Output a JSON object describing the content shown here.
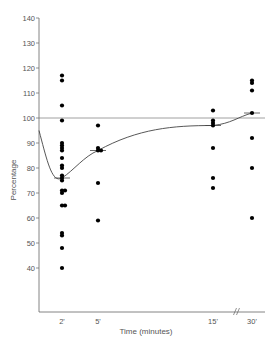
{
  "chart_data": {
    "type": "scatter",
    "title": "",
    "xlabel": "Time (minutes)",
    "ylabel": "Percentage",
    "ylim": [
      17.6,
      140
    ],
    "yticks": [
      40,
      50,
      60,
      70,
      80,
      90,
      100,
      110,
      120,
      130,
      140
    ],
    "xticks": [
      "2'",
      "5'",
      "15'",
      "30'"
    ],
    "axis_break_between": [
      "15'",
      "30'"
    ],
    "reference_line": 100,
    "grid": false,
    "legend": null,
    "series": [
      {
        "name": "individual values",
        "x": "2'",
        "values": [
          117,
          115,
          105,
          99,
          90,
          89,
          88,
          87,
          84,
          81,
          80,
          77,
          76,
          75,
          71,
          71,
          70,
          65,
          65,
          54,
          53,
          48,
          40
        ]
      },
      {
        "name": "individual values",
        "x": "5'",
        "values": [
          97,
          88,
          87,
          87,
          74,
          59
        ]
      },
      {
        "name": "individual values",
        "x": "15'",
        "values": [
          103,
          99,
          98,
          97,
          88,
          76,
          72
        ]
      },
      {
        "name": "individual values",
        "x": "30'",
        "values": [
          115,
          114,
          111,
          102,
          92,
          80,
          60
        ]
      }
    ],
    "mean_curve": [
      {
        "x": "0",
        "value": 95
      },
      {
        "x": "2'",
        "value": 76
      },
      {
        "x": "5'",
        "value": 87
      },
      {
        "x": "15'",
        "value": 97
      },
      {
        "x": "30'",
        "value": 102
      }
    ]
  }
}
